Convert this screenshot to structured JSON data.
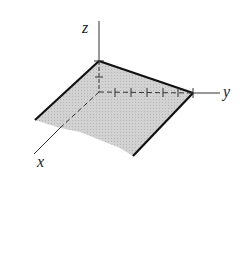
{
  "diagram": {
    "type": "3d-coordinate-axes-with-plane",
    "axes": {
      "x_label": "x",
      "y_label": "y",
      "z_label": "z"
    },
    "plane": {
      "fill": "#c8c8c8",
      "edge_color": "#111111",
      "description": "shaded quadrilateral region"
    },
    "y_ticks": 6,
    "z_ticks": 2
  }
}
